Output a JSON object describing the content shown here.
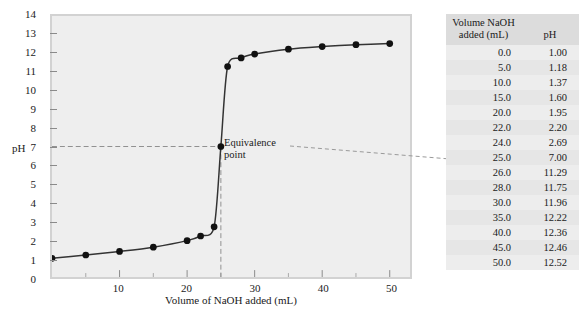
{
  "chart_data": {
    "type": "line",
    "title": "",
    "xlabel": "Volume of NaOH added (mL)",
    "ylabel": "pH",
    "xlim": [
      0,
      53
    ],
    "ylim": [
      0,
      14
    ],
    "grid": false,
    "legend": "none",
    "x": [
      0.0,
      5.0,
      10.0,
      15.0,
      20.0,
      22.0,
      24.0,
      25.0,
      26.0,
      28.0,
      30.0,
      35.0,
      40.0,
      45.0,
      50.0
    ],
    "values": [
      1.0,
      1.18,
      1.37,
      1.6,
      1.95,
      2.2,
      2.69,
      7.0,
      11.29,
      11.75,
      11.96,
      12.22,
      12.36,
      12.46,
      12.52
    ],
    "series": [
      {
        "name": "Titration of strong acid with NaOH",
        "values": [
          1.0,
          1.18,
          1.37,
          1.6,
          1.95,
          2.2,
          2.69,
          7.0,
          11.29,
          11.75,
          11.96,
          12.22,
          12.36,
          12.46,
          12.52
        ]
      }
    ],
    "xticks": [
      10,
      20,
      30,
      40,
      50
    ],
    "xticks_minor": [
      5,
      15,
      25,
      35,
      45
    ],
    "yticks": [
      0,
      1,
      2,
      3,
      4,
      5,
      6,
      7,
      8,
      9,
      10,
      11,
      12,
      13,
      14
    ],
    "annotations": [
      {
        "label": "Equivalence point",
        "line1": "Equivalence",
        "line2": "point",
        "x": 25.0,
        "y": 7.0
      }
    ],
    "guide_lines": [
      {
        "type": "horizontal",
        "value": 7.0,
        "style": "dashed"
      },
      {
        "type": "vertical",
        "value": 25.0,
        "style": "dashed"
      }
    ],
    "colors": {
      "plot_background": "#eeeeee",
      "curve": "#333333",
      "marker": "#111111",
      "frame": "#d2d2d2",
      "guide": "#909090",
      "table_header_background": "#dcdcdc",
      "table_row_background": "#e9e9e9"
    }
  },
  "table": {
    "headers": {
      "volume_line1": "Volume NaOH",
      "volume_line2": "added (mL)",
      "ph": "pH"
    },
    "rows": [
      {
        "volume": "0.0",
        "ph": "1.00"
      },
      {
        "volume": "5.0",
        "ph": "1.18"
      },
      {
        "volume": "10.0",
        "ph": "1.37"
      },
      {
        "volume": "15.0",
        "ph": "1.60"
      },
      {
        "volume": "20.0",
        "ph": "1.95"
      },
      {
        "volume": "22.0",
        "ph": "2.20"
      },
      {
        "volume": "24.0",
        "ph": "2.69"
      },
      {
        "volume": "25.0",
        "ph": "7.00"
      },
      {
        "volume": "26.0",
        "ph": "11.29"
      },
      {
        "volume": "28.0",
        "ph": "11.75"
      },
      {
        "volume": "30.0",
        "ph": "11.96"
      },
      {
        "volume": "35.0",
        "ph": "12.22"
      },
      {
        "volume": "40.0",
        "ph": "12.36"
      },
      {
        "volume": "45.0",
        "ph": "12.46"
      },
      {
        "volume": "50.0",
        "ph": "12.52"
      }
    ]
  },
  "axis": {
    "y_title": "pH",
    "x_title": "Volume of NaOH added (mL)",
    "y_labels": [
      "14",
      "13",
      "12",
      "11",
      "10",
      "9",
      "8",
      "7",
      "6",
      "5",
      "4",
      "3",
      "2",
      "1",
      "0"
    ],
    "x_labels": [
      "10",
      "20",
      "30",
      "40",
      "50"
    ]
  },
  "annotation": {
    "equivalence_line1": "Equivalence",
    "equivalence_line2": "point"
  }
}
